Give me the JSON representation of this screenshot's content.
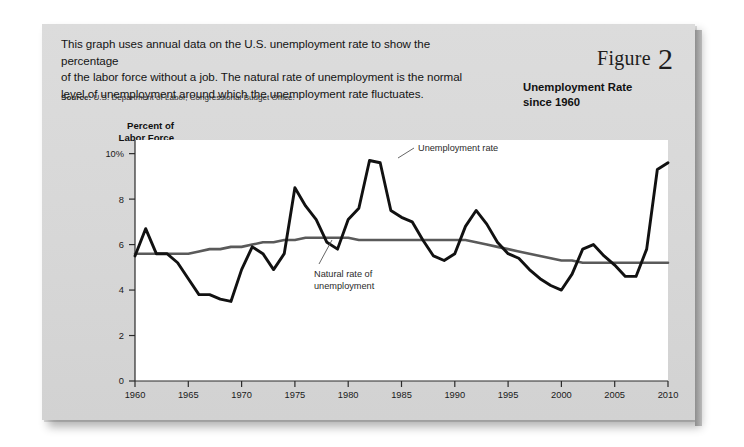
{
  "figure": {
    "word": "Figure",
    "number": "2",
    "subtitle_line1": "Unemployment Rate",
    "subtitle_line2": "since 1960"
  },
  "headline": {
    "line1": "This graph uses annual data on the U.S. unemployment rate to show the percentage",
    "line2": "of the labor force without a job. The natural rate of unemployment is the normal",
    "line3": "level of unemployment around which the unemployment rate fluctuates."
  },
  "source": {
    "label": "Source:",
    "text": "U.S. Department of Labor, Congressional Budget Office."
  },
  "axis_title": {
    "line1": "Percent of",
    "line2": "Labor Force"
  },
  "annotations": {
    "unemployment_rate": "Unemployment rate",
    "natural_rate_line1": "Natural rate of",
    "natural_rate_line2": "unemployment"
  },
  "colors": {
    "card_background": "#d9d9d9",
    "plot_background": "#ffffff",
    "unemployment_line": "#111111",
    "natural_rate_line": "#5a5a5a",
    "axis": "#2b2b2b",
    "text": "#141414"
  },
  "chart_data": {
    "type": "line",
    "title": "Unemployment Rate since 1960",
    "xlabel": "",
    "ylabel": "Percent of Labor Force",
    "xlim": [
      1960,
      2010
    ],
    "ylim": [
      0,
      10.6
    ],
    "grid": false,
    "legend": "annotated-inline",
    "xticks": [
      1960,
      1965,
      1970,
      1975,
      1980,
      1985,
      1990,
      1995,
      2000,
      2005,
      2010
    ],
    "xtick_labels": [
      "1960",
      "1965",
      "1970",
      "1975",
      "1980",
      "1985",
      "1990",
      "1995",
      "2000",
      "2005",
      "2010"
    ],
    "yticks": [
      0,
      2,
      4,
      6,
      8,
      10
    ],
    "ytick_labels": [
      "0",
      "2",
      "4",
      "6",
      "8",
      "10%"
    ],
    "x": [
      1960,
      1961,
      1962,
      1963,
      1964,
      1965,
      1966,
      1967,
      1968,
      1969,
      1970,
      1971,
      1972,
      1973,
      1974,
      1975,
      1976,
      1977,
      1978,
      1979,
      1980,
      1981,
      1982,
      1983,
      1984,
      1985,
      1986,
      1987,
      1988,
      1989,
      1990,
      1991,
      1992,
      1993,
      1994,
      1995,
      1996,
      1997,
      1998,
      1999,
      2000,
      2001,
      2002,
      2003,
      2004,
      2005,
      2006,
      2007,
      2008,
      2009,
      2010
    ],
    "series": [
      {
        "name": "Unemployment rate",
        "color": "#111111",
        "values": [
          5.5,
          6.7,
          5.6,
          5.6,
          5.2,
          4.5,
          3.8,
          3.8,
          3.6,
          3.5,
          4.9,
          5.9,
          5.6,
          4.9,
          5.6,
          8.5,
          7.7,
          7.1,
          6.1,
          5.8,
          7.1,
          7.6,
          9.7,
          9.6,
          7.5,
          7.2,
          7.0,
          6.2,
          5.5,
          5.3,
          5.6,
          6.8,
          7.5,
          6.9,
          6.1,
          5.6,
          5.4,
          4.9,
          4.5,
          4.2,
          4.0,
          4.7,
          5.8,
          6.0,
          5.5,
          5.1,
          4.6,
          4.6,
          5.8,
          9.3,
          9.6
        ]
      },
      {
        "name": "Natural rate of unemployment",
        "color": "#5a5a5a",
        "values": [
          5.6,
          5.6,
          5.6,
          5.6,
          5.6,
          5.6,
          5.7,
          5.8,
          5.8,
          5.9,
          5.9,
          6.0,
          6.1,
          6.1,
          6.2,
          6.2,
          6.3,
          6.3,
          6.3,
          6.3,
          6.3,
          6.2,
          6.2,
          6.2,
          6.2,
          6.2,
          6.2,
          6.2,
          6.2,
          6.2,
          6.2,
          6.2,
          6.1,
          6.0,
          5.9,
          5.8,
          5.7,
          5.6,
          5.5,
          5.4,
          5.3,
          5.3,
          5.2,
          5.2,
          5.2,
          5.2,
          5.2,
          5.2,
          5.2,
          5.2,
          5.2
        ]
      }
    ],
    "annotations": [
      {
        "text": "Unemployment rate",
        "at_x": 1986,
        "at_y": 10.0
      },
      {
        "text": "Natural rate of unemployment",
        "at_x": 1977.5,
        "at_y": 4.4
      }
    ]
  }
}
